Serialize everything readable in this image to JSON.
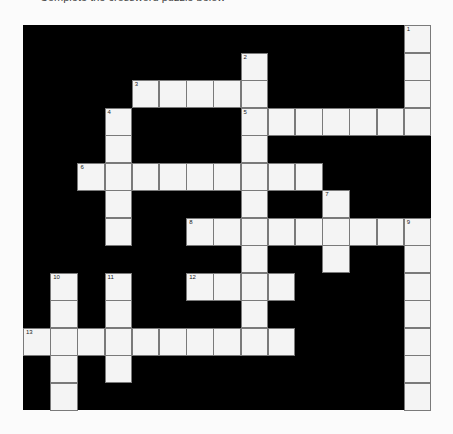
{
  "intro_text": "Complete the crossword puzzle below",
  "puzzle": {
    "cols": 15,
    "rows": 14,
    "colors": {
      "background": "#fbfbfb",
      "block": "#000000",
      "cell": "#f4f4f4",
      "cell_border": "#7a7a7a"
    },
    "entries": [
      {
        "number": "1",
        "direction": "down",
        "row": 0,
        "col": 14,
        "length": 4
      },
      {
        "number": "2",
        "direction": "down",
        "row": 1,
        "col": 8,
        "length": 11
      },
      {
        "number": "3",
        "direction": "across",
        "row": 2,
        "col": 4,
        "length": 5
      },
      {
        "number": "4",
        "direction": "down",
        "row": 3,
        "col": 3,
        "length": 5
      },
      {
        "number": "5",
        "direction": "across",
        "row": 3,
        "col": 8,
        "length": 7
      },
      {
        "number": "6",
        "direction": "across",
        "row": 5,
        "col": 2,
        "length": 9
      },
      {
        "number": "7",
        "direction": "down",
        "row": 6,
        "col": 11,
        "length": 3
      },
      {
        "number": "8",
        "direction": "across",
        "row": 7,
        "col": 6,
        "length": 9
      },
      {
        "number": "9",
        "direction": "down",
        "row": 7,
        "col": 14,
        "length": 7
      },
      {
        "number": "10",
        "direction": "down",
        "row": 9,
        "col": 1,
        "length": 5
      },
      {
        "number": "11",
        "direction": "down",
        "row": 9,
        "col": 3,
        "length": 4
      },
      {
        "number": "12",
        "direction": "across",
        "row": 9,
        "col": 6,
        "length": 4
      },
      {
        "number": "13",
        "direction": "across",
        "row": 11,
        "col": 0,
        "length": 10
      }
    ]
  }
}
